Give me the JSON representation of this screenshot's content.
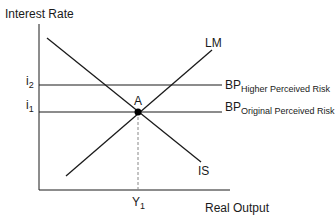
{
  "diagram": {
    "y_axis_label": "Interest Rate",
    "x_axis_label": "Real Output",
    "curves": {
      "lm": "LM",
      "is": "IS",
      "bp_high": {
        "main": "BP",
        "sub": "Higher Perceived Risk"
      },
      "bp_orig": {
        "main": "BP",
        "sub": "Original Perceived Risk"
      }
    },
    "ticks": {
      "i2": {
        "main": "i",
        "sub": "2"
      },
      "i1": {
        "main": "i",
        "sub": "1"
      },
      "y1": {
        "main": "Y",
        "sub": "1"
      }
    },
    "point_label": "A",
    "colors": {
      "line": "#1a1a1a",
      "dashed": "#888888",
      "background": "#ffffff"
    }
  }
}
